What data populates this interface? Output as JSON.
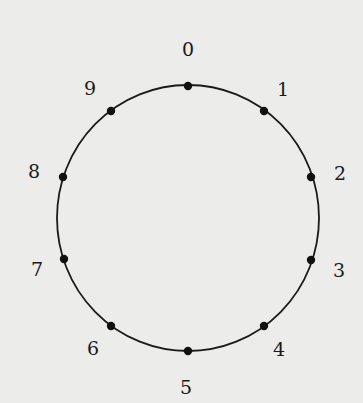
{
  "diagram": {
    "type": "circle-with-labeled-points",
    "center": [
      188,
      218
    ],
    "radius_x": 131,
    "radius_y": 133,
    "stroke_color": "#1a1a1a",
    "dot_color": "#111111",
    "background": "#ececea",
    "points": [
      {
        "label": "0",
        "dot": [
          188,
          86
        ],
        "text": [
          188,
          56
        ]
      },
      {
        "label": "1",
        "dot": [
          264,
          111
        ],
        "text": [
          283,
          96
        ]
      },
      {
        "label": "2",
        "dot": [
          311,
          177
        ],
        "text": [
          340,
          180
        ]
      },
      {
        "label": "3",
        "dot": [
          311,
          260
        ],
        "text": [
          339,
          277
        ]
      },
      {
        "label": "4",
        "dot": [
          264,
          326
        ],
        "text": [
          279,
          356
        ]
      },
      {
        "label": "5",
        "dot": [
          188,
          351
        ],
        "text": [
          186,
          394
        ]
      },
      {
        "label": "6",
        "dot": [
          111,
          326
        ],
        "text": [
          93,
          355
        ]
      },
      {
        "label": "7",
        "dot": [
          64,
          259
        ],
        "text": [
          37,
          276
        ]
      },
      {
        "label": "8",
        "dot": [
          63,
          177
        ],
        "text": [
          34,
          178
        ]
      },
      {
        "label": "9",
        "dot": [
          111,
          111
        ],
        "text": [
          90,
          95
        ]
      }
    ]
  }
}
